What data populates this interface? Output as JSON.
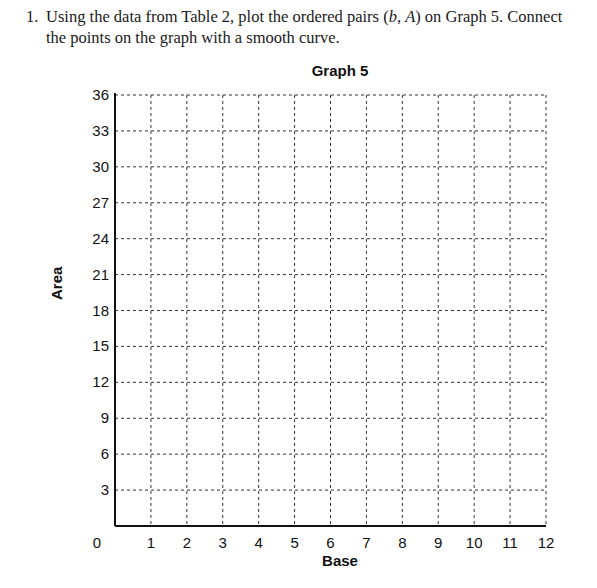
{
  "question": {
    "number": "1.",
    "text_before": "Using the data from Table 2, plot the ordered pairs (",
    "var_b": "b",
    "text_sep": ", ",
    "var_A": "A",
    "text_after": ") on Graph 5. Connect the points on the graph with a smooth curve."
  },
  "chart_data": {
    "type": "scatter",
    "title": "Graph 5",
    "xlabel": "Base",
    "ylabel": "Area",
    "xlim": [
      0,
      12
    ],
    "ylim": [
      0,
      36
    ],
    "x_ticks": [
      "0",
      "1",
      "2",
      "3",
      "4",
      "5",
      "6",
      "7",
      "8",
      "9",
      "10",
      "11",
      "12"
    ],
    "y_ticks": [
      "3",
      "6",
      "9",
      "12",
      "15",
      "18",
      "21",
      "24",
      "27",
      "30",
      "33",
      "36"
    ],
    "grid": "dashed",
    "series": [],
    "note": "Blank graph grid; no data points plotted"
  }
}
